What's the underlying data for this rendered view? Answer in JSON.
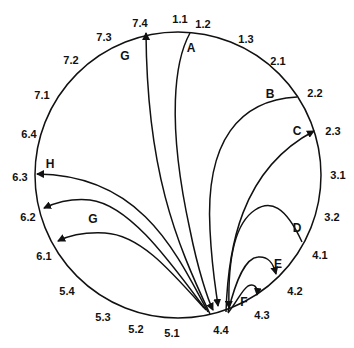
{
  "diagram": {
    "circle": {
      "cx": 178,
      "cy": 175,
      "r": 143,
      "stroke": "#111111"
    },
    "points": [
      {
        "id": "1.1",
        "x": 180,
        "y": 20
      },
      {
        "id": "1.2",
        "x": 203,
        "y": 25
      },
      {
        "id": "1.3",
        "x": 246,
        "y": 40
      },
      {
        "id": "2.1",
        "x": 278,
        "y": 62
      },
      {
        "id": "2.2",
        "x": 315,
        "y": 94
      },
      {
        "id": "2.3",
        "x": 333,
        "y": 132
      },
      {
        "id": "3.1",
        "x": 338,
        "y": 176
      },
      {
        "id": "3.2",
        "x": 332,
        "y": 218
      },
      {
        "id": "4.1",
        "x": 320,
        "y": 256
      },
      {
        "id": "4.2",
        "x": 295,
        "y": 292
      },
      {
        "id": "4.3",
        "x": 262,
        "y": 316
      },
      {
        "id": "4.4",
        "x": 221,
        "y": 331
      },
      {
        "id": "5.1",
        "x": 172,
        "y": 334
      },
      {
        "id": "5.2",
        "x": 136,
        "y": 330
      },
      {
        "id": "5.3",
        "x": 103,
        "y": 318
      },
      {
        "id": "5.4",
        "x": 67,
        "y": 292
      },
      {
        "id": "6.1",
        "x": 44,
        "y": 257
      },
      {
        "id": "6.2",
        "x": 28,
        "y": 218
      },
      {
        "id": "6.3",
        "x": 20,
        "y": 178
      },
      {
        "id": "6.4",
        "x": 29,
        "y": 135
      },
      {
        "id": "7.1",
        "x": 42,
        "y": 96
      },
      {
        "id": "7.2",
        "x": 71,
        "y": 61
      },
      {
        "id": "7.3",
        "x": 104,
        "y": 38
      },
      {
        "id": "7.4",
        "x": 140,
        "y": 24
      }
    ],
    "curves": [
      {
        "label": "A",
        "label_x": 191,
        "label_y": 49,
        "from": "1.2",
        "to": "4.4",
        "d": "M190,33 C175,60 166,120 190,230 C198,270 208,300 213,310",
        "arrow_end": "4.4"
      },
      {
        "label": "B",
        "label_x": 270,
        "label_y": 95,
        "from": "2.2",
        "to": "4.4",
        "d": "M297,97 C240,100 205,140 210,230 C212,270 216,290 218,306",
        "arrow_end": "4.4"
      },
      {
        "label": "C",
        "label_x": 297,
        "label_y": 132,
        "from": "4.4",
        "to": "2.3",
        "d": "M226,312 C228,250 240,170 314,131",
        "arrow_end": "2.3"
      },
      {
        "label": "D",
        "label_x": 297,
        "label_y": 229,
        "from": "4.1",
        "to": "4.4",
        "d": "M302,242 C285,205 270,200 255,210 C232,225 228,270 229,308",
        "arrow_end": "4.4"
      },
      {
        "label": "E",
        "label_x": 278,
        "label_y": 265,
        "from": "4.4",
        "to": "4.2",
        "d": "M228,312 C236,280 245,258 258,257 C268,256 273,262 276,274",
        "arrow_end": "4.2"
      },
      {
        "label": "F",
        "label_x": 244,
        "label_y": 303,
        "from": "4.4",
        "to": "4.3",
        "d": "M228,313 C238,300 242,290 248,286 C254,283 258,287 257,295",
        "arrow_end": "4.3"
      },
      {
        "label": "G",
        "label_x": 125,
        "label_y": 57,
        "from": "4.4",
        "to": "7.4",
        "d": "M210,314 C175,240 147,170 146,33",
        "arrow_end": "7.4"
      },
      {
        "label": "H",
        "label_x": 50,
        "label_y": 165,
        "from": "4.4",
        "to": "6.3",
        "d": "M208,312 C175,250 140,175 37,174",
        "arrow_end": "6.3"
      },
      {
        "label": "G",
        "label_x": 93,
        "label_y": 220,
        "from": "4.4",
        "to": "6.2",
        "d": "M206,310 C170,262 130,205 90,200 C70,198 55,203 44,208",
        "arrow_end": "6.2"
      },
      {
        "label": "",
        "label_x": 0,
        "label_y": 0,
        "from": "4.4",
        "to": "6.1",
        "d": "M204,308 C170,270 140,235 105,233 C85,232 70,235 58,241",
        "arrow_end": "6.1"
      }
    ],
    "legend": {
      "curve_labels": [
        "A",
        "B",
        "C",
        "D",
        "E",
        "F",
        "G",
        "H",
        "G"
      ],
      "hub_point": "4.4"
    }
  }
}
